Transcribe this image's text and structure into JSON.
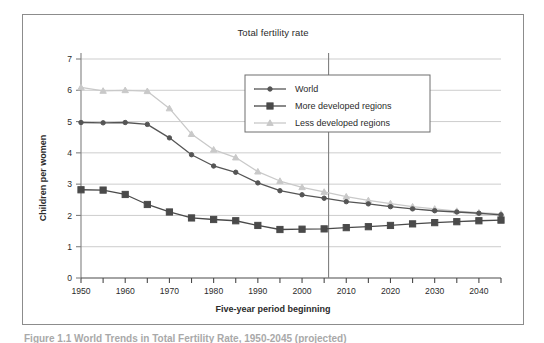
{
  "figure": {
    "title": "Total fertility rate",
    "xlabel": "Five-year period beginning",
    "ylabel": "Children per women",
    "caption": "Figure 1.1  World Trends in Total Fertility Rate, 1950-2045 (projected)"
  },
  "colors": {
    "world": "#555555",
    "more_developed": "#4a4a4a",
    "less_developed": "#c9c9c9",
    "grid": "#c0c0c0",
    "axis": "#808080",
    "frame": "#8c8c8c",
    "text": "#2b2b2b",
    "background": "#ffffff"
  },
  "legend": {
    "position": "top-right-inside",
    "entries": [
      {
        "label": "World",
        "marker": "circle",
        "color": "#555555"
      },
      {
        "label": "More developed regions",
        "marker": "square",
        "color": "#4a4a4a"
      },
      {
        "label": "Less developed regions",
        "marker": "triangle",
        "color": "#c9c9c9"
      }
    ]
  },
  "chart_data": {
    "type": "line",
    "title": "Total fertility rate",
    "xlabel": "Five-year period beginning",
    "ylabel": "Children per women",
    "xlim": [
      1950,
      2045
    ],
    "ylim": [
      0,
      7
    ],
    "ytick_values": [
      0,
      1,
      2,
      3,
      4,
      5,
      6,
      7
    ],
    "ytick_labels": [
      "0",
      "1",
      "2",
      "3",
      "4",
      "5",
      "6",
      "7"
    ],
    "xtick_values": [
      1950,
      1955,
      1960,
      1965,
      1970,
      1975,
      1980,
      1985,
      1990,
      1995,
      2000,
      2005,
      2010,
      2015,
      2020,
      2025,
      2030,
      2035,
      2040,
      2045
    ],
    "xtick_labels_shown": [
      "1950",
      "1960",
      "1970",
      "1980",
      "1990",
      "2000",
      "2010",
      "2020",
      "2030",
      "2040"
    ],
    "grid": "horizontal",
    "legend_position": "upper right",
    "annotations": [
      {
        "type": "vline",
        "x": 2006,
        "note": "projection boundary",
        "color": "#808080"
      }
    ],
    "x": [
      1950,
      1955,
      1960,
      1965,
      1970,
      1975,
      1980,
      1985,
      1990,
      1995,
      2000,
      2005,
      2010,
      2015,
      2020,
      2025,
      2030,
      2035,
      2040,
      2045
    ],
    "series": [
      {
        "name": "World",
        "marker": "circle",
        "color": "#555555",
        "values": [
          4.97,
          4.96,
          4.97,
          4.91,
          4.48,
          3.94,
          3.58,
          3.38,
          3.04,
          2.79,
          2.66,
          2.55,
          2.44,
          2.37,
          2.28,
          2.21,
          2.15,
          2.11,
          2.07,
          2.02
        ]
      },
      {
        "name": "More developed regions",
        "marker": "square",
        "color": "#4a4a4a",
        "values": [
          2.82,
          2.81,
          2.67,
          2.35,
          2.11,
          1.92,
          1.87,
          1.83,
          1.68,
          1.55,
          1.56,
          1.57,
          1.61,
          1.64,
          1.68,
          1.73,
          1.77,
          1.8,
          1.83,
          1.85
        ]
      },
      {
        "name": "Less developed regions",
        "marker": "triangle",
        "color": "#c9c9c9",
        "values": [
          6.09,
          5.98,
          6.0,
          5.97,
          5.42,
          4.6,
          4.1,
          3.85,
          3.4,
          3.1,
          2.9,
          2.75,
          2.6,
          2.48,
          2.38,
          2.28,
          2.21,
          2.14,
          2.09,
          2.05
        ]
      }
    ]
  }
}
